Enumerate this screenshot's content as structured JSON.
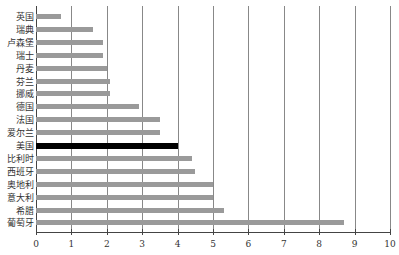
{
  "chart_data": {
    "type": "bar",
    "orientation": "horizontal",
    "title": "",
    "xlabel": "",
    "ylabel": "",
    "xlim": [
      0,
      10
    ],
    "x_ticks": [
      "0",
      "1",
      "2",
      "3",
      "4",
      "5",
      "6",
      "7",
      "8",
      "9",
      "10"
    ],
    "grid": "vertical",
    "highlight_category": "美国",
    "colors": {
      "default": "#9a9a9a",
      "highlight": "#000000"
    },
    "categories": [
      "英国",
      "瑞典",
      "卢森堡",
      "瑞士",
      "丹麦",
      "芬兰",
      "挪威",
      "德国",
      "法国",
      "爱尔兰",
      "美国",
      "比利时",
      "西班牙",
      "奥地利",
      "意大利",
      "希腊",
      "葡萄牙"
    ],
    "values": [
      0.7,
      1.6,
      1.9,
      1.9,
      2.0,
      2.1,
      2.1,
      2.9,
      3.5,
      3.5,
      4.0,
      4.4,
      4.5,
      5.0,
      5.0,
      5.3,
      8.7
    ]
  }
}
